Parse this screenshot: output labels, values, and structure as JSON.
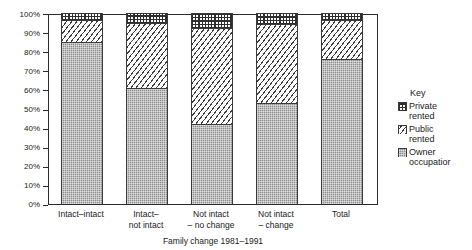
{
  "chart_data": {
    "type": "bar",
    "stacked": true,
    "title": "",
    "xlabel": "Family change 1981–1991",
    "ylabel": "",
    "ylim": [
      0,
      100
    ],
    "ytick_labels": [
      "100%",
      "90%",
      "80%",
      "70%",
      "60%",
      "50%",
      "40%",
      "30%",
      "20%",
      "10%",
      "0%"
    ],
    "ytick_values": [
      100,
      90,
      80,
      70,
      60,
      50,
      40,
      30,
      20,
      10,
      0
    ],
    "grid": false,
    "legend_position": "right",
    "categories": [
      "Intact–intact",
      "Intact–\nnot intact",
      "Not intact\n– no change",
      "Not intact\n– change",
      "Total"
    ],
    "series": [
      {
        "name": "Owner occupation",
        "values": [
          85,
          61,
          42,
          53,
          76
        ]
      },
      {
        "name": "Public rented",
        "values": [
          11.5,
          34,
          50,
          41,
          20.5
        ]
      },
      {
        "name": "Private rented",
        "values": [
          3.5,
          5,
          8,
          6,
          3.5
        ]
      }
    ]
  },
  "axis": {
    "x_title": "Family change 1981–1991"
  },
  "legend": {
    "title": "Key",
    "items": [
      {
        "label": "Private\nrented",
        "swatch": "crosshatch-pattern"
      },
      {
        "label": "Public\nrented",
        "swatch": "diagonal-hatch-pattern"
      },
      {
        "label": "Owner\noccupatior",
        "swatch": "solid-gray-pattern"
      }
    ]
  }
}
